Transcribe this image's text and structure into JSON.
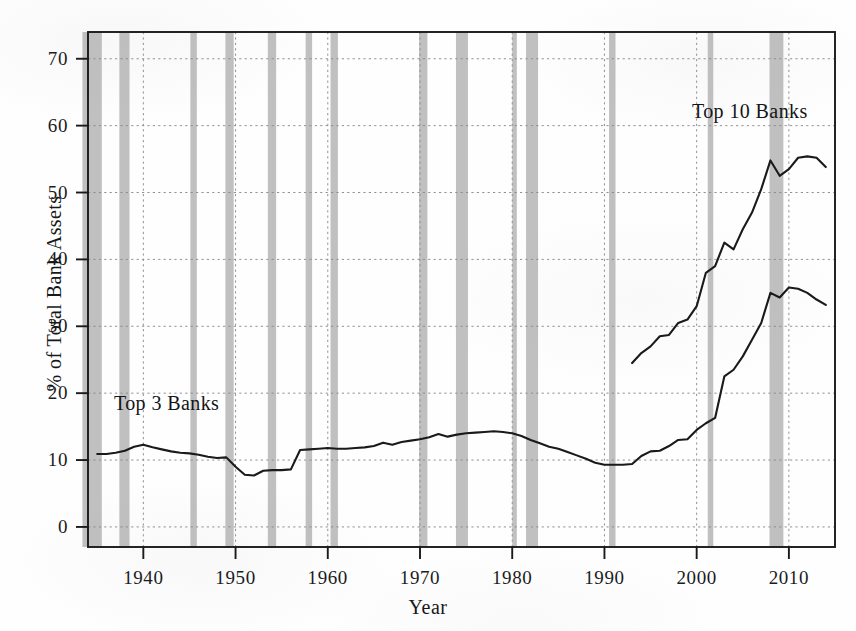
{
  "chart_data": {
    "type": "line",
    "title": "",
    "subtitle": "",
    "xlabel": "Year",
    "ylabel": "% of Total Bank Assets",
    "xlim": [
      1934,
      2015
    ],
    "ylim": [
      -3,
      74
    ],
    "xticks": [
      1940,
      1950,
      1960,
      1970,
      1980,
      1990,
      2000,
      2010
    ],
    "xtick_labels": [
      "1940",
      "1950",
      "1960",
      "1970",
      "1980",
      "1990",
      "2000",
      "2010"
    ],
    "yticks": [
      0,
      10,
      20,
      30,
      40,
      50,
      60,
      70
    ],
    "ytick_labels": [
      "0",
      "10",
      "20",
      "30",
      "40",
      "50",
      "60",
      "70"
    ],
    "grid": "dotted both axes",
    "legend_position": "inline annotations on series",
    "line_color": "#1a1a1a",
    "recession_band_color": "#a8a8a8",
    "grid_color": "#8c8c8c",
    "axis_color": "#1a1a1a",
    "background_color": "#ffffff",
    "annotations": [
      {
        "text": "Top 3 Banks",
        "x": 1938,
        "y": 19
      },
      {
        "text": "Top 10 Banks",
        "x": 2002,
        "y": 58
      }
    ],
    "series": [
      {
        "name": "Top 3 Banks",
        "label": "Top 3 Banks",
        "x": [
          1935,
          1936,
          1937,
          1938,
          1939,
          1940,
          1941,
          1942,
          1943,
          1944,
          1945,
          1946,
          1947,
          1948,
          1949,
          1950,
          1951,
          1952,
          1953,
          1954,
          1955,
          1956,
          1957,
          1958,
          1959,
          1960,
          1961,
          1962,
          1963,
          1964,
          1965,
          1966,
          1967,
          1968,
          1969,
          1970,
          1971,
          1972,
          1973,
          1974,
          1975,
          1976,
          1977,
          1978,
          1979,
          1980,
          1981,
          1982,
          1983,
          1984,
          1985,
          1986,
          1987,
          1988,
          1989,
          1990,
          1991,
          1992,
          1993,
          1994,
          1995,
          1996,
          1997,
          1998,
          1999,
          2000,
          2001,
          2002,
          2003,
          2004,
          2005,
          2006,
          2007,
          2008,
          2009,
          2010,
          2011,
          2012,
          2013,
          2014
        ],
        "values": [
          10.9,
          10.9,
          11.1,
          11.4,
          12.0,
          12.3,
          11.9,
          11.6,
          11.3,
          11.1,
          11.0,
          10.8,
          10.5,
          10.3,
          10.4,
          9.0,
          7.8,
          7.7,
          8.4,
          8.5,
          8.5,
          8.6,
          11.5,
          11.6,
          11.7,
          11.8,
          11.7,
          11.7,
          11.8,
          11.9,
          12.1,
          12.6,
          12.3,
          12.7,
          12.9,
          13.1,
          13.4,
          13.9,
          13.5,
          13.8,
          14.0,
          14.1,
          14.2,
          14.3,
          14.2,
          14.0,
          13.6,
          13.0,
          12.5,
          12.0,
          11.7,
          11.2,
          10.7,
          10.2,
          9.6,
          9.3,
          9.3,
          9.3,
          9.4,
          10.6,
          11.3,
          11.4,
          12.1,
          13.0,
          13.1,
          14.5,
          15.5,
          16.3,
          22.5,
          23.5,
          25.5,
          28.0,
          30.5,
          35.0,
          34.3,
          35.8,
          35.6,
          35.0,
          34.0,
          33.2
        ]
      },
      {
        "name": "Top 10 Banks",
        "label": "Top 10 Banks",
        "x": [
          1993,
          1994,
          1995,
          1996,
          1997,
          1998,
          1999,
          2000,
          2001,
          2002,
          2003,
          2004,
          2005,
          2006,
          2007,
          2008,
          2009,
          2010,
          2011,
          2012,
          2013,
          2014
        ],
        "values": [
          24.5,
          26.0,
          27.0,
          28.5,
          28.7,
          30.5,
          31.0,
          33.0,
          38.0,
          39.0,
          42.5,
          41.5,
          44.5,
          47.0,
          50.5,
          54.8,
          52.5,
          53.5,
          55.2,
          55.4,
          55.2,
          53.8
        ]
      }
    ],
    "recession_bands": [
      {
        "start": 1933.4,
        "end": 1935.5,
        "label": "Great Depression tail"
      },
      {
        "start": 1937.4,
        "end": 1938.5,
        "label": "1937-38 recession"
      },
      {
        "start": 1945.1,
        "end": 1945.8,
        "label": "1945 recession"
      },
      {
        "start": 1948.9,
        "end": 1949.8,
        "label": "1948-49 recession"
      },
      {
        "start": 1953.5,
        "end": 1954.4,
        "label": "1953-54 recession"
      },
      {
        "start": 1957.6,
        "end": 1958.3,
        "label": "1957-58 recession"
      },
      {
        "start": 1960.3,
        "end": 1961.1,
        "label": "1960-61 recession"
      },
      {
        "start": 1969.9,
        "end": 1970.8,
        "label": "1969-70 recession"
      },
      {
        "start": 1973.9,
        "end": 1975.2,
        "label": "1973-75 recession"
      },
      {
        "start": 1980.0,
        "end": 1980.5,
        "label": "1980 recession"
      },
      {
        "start": 1981.5,
        "end": 1982.8,
        "label": "1981-82 recession"
      },
      {
        "start": 1990.5,
        "end": 1991.2,
        "label": "1990-91 recession"
      },
      {
        "start": 2001.2,
        "end": 2001.8,
        "label": "2001 recession"
      },
      {
        "start": 2007.9,
        "end": 2009.4,
        "label": "2007-09 Great Recession"
      }
    ]
  },
  "axis": {
    "y_title": "% of Total Bank Assets",
    "x_title": "Year"
  },
  "annotations": {
    "top3": "Top 3 Banks",
    "top10": "Top 10 Banks"
  }
}
